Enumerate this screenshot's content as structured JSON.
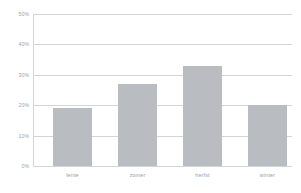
{
  "chart_data": {
    "type": "bar",
    "title": "",
    "subtitle": "",
    "xlabel": "",
    "ylabel": "",
    "categories": [
      "lente",
      "zomer",
      "herfst",
      "winter"
    ],
    "values": [
      19,
      27,
      33,
      20
    ],
    "value_suffix": "%",
    "ylim": [
      0,
      50
    ],
    "ytick_values": [
      0,
      10,
      20,
      30,
      40,
      50
    ],
    "ytick_labels": [
      "0%",
      "10%",
      "20%",
      "30%",
      "40%",
      "50%"
    ],
    "grid": true,
    "grid_axis": "y",
    "legend": false,
    "legend_position": "none",
    "series": [
      {
        "name": "",
        "values": [
          19,
          27,
          33,
          20
        ]
      }
    ],
    "colors": {
      "bar_fill": "#b9bdc1",
      "gridline": "#d2d5d8",
      "axis": "#d2d5d8",
      "tick_text": "#9a9ea3",
      "background": "#ffffff"
    }
  }
}
